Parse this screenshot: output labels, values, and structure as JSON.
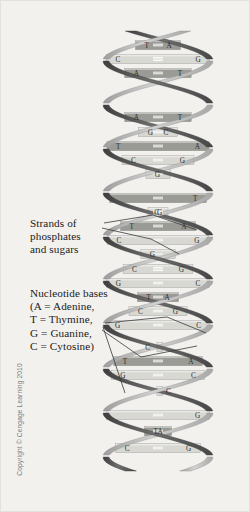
{
  "figure": {
    "background_color": "#f2f1ee",
    "frame_color": "#e2e1dd"
  },
  "annotations": {
    "strands_label": "Strands of\nphosphates\nand sugars",
    "bases_label": "Nucleotide bases\n(A = Adenine,\nT = Thymine,\nG = Guanine,\nC = Cytosine)"
  },
  "credit": {
    "text": "Copyright © Cengage Learning 2010",
    "color": "#7c7c7c"
  },
  "legend": {
    "entries": [
      {
        "code": "A",
        "name": "Adenine"
      },
      {
        "code": "T",
        "name": "Thymine"
      },
      {
        "code": "G",
        "name": "Guanine"
      },
      {
        "code": "C",
        "name": "Cytosine"
      }
    ]
  },
  "colors": {
    "backbone_dark": "#5d5d5d",
    "backbone_light": "#b9b9b9",
    "rung_light": "#d8d8d2",
    "rung_dark": "#9b9b96",
    "base_text": "#2a2a2a",
    "hbond": "#ffffff",
    "leader_line": "#3a3a3a"
  },
  "chart_data": {
    "type": "diagram",
    "base_pairs": [
      {
        "index": 1,
        "y": 44,
        "left": "T",
        "right": "A",
        "bonds": 2,
        "shade": "dark",
        "x_left": 126,
        "x_right": 205,
        "width": 96,
        "x": 118
      },
      {
        "index": 2,
        "y": 58,
        "left": "C",
        "right": "G",
        "bonds": 3,
        "shade": "light",
        "x_left": 117,
        "x_right": 213,
        "width": 112,
        "x": 110
      },
      {
        "index": 3,
        "y": 72,
        "left": "A",
        "right": "T",
        "bonds": 2,
        "shade": "dark",
        "x_left": 113,
        "x_right": 165,
        "width": 72,
        "x": 106
      },
      {
        "index": 4,
        "y": 116,
        "left": "A",
        "right": "T",
        "bonds": 2,
        "shade": "dark",
        "x_left": 113,
        "x_right": 163,
        "width": 70,
        "x": 106
      },
      {
        "index": 5,
        "y": 131,
        "left": "G",
        "right": "C",
        "bonds": 2,
        "shade": "light",
        "x_left": 110,
        "x_right": 166,
        "width": 90,
        "x": 103
      },
      {
        "index": 6,
        "y": 145,
        "left": "T",
        "right": "A",
        "bonds": 2,
        "shade": "dark",
        "x_left": 125,
        "x_right": 205,
        "width": 100,
        "x": 116
      },
      {
        "index": 7,
        "y": 159,
        "left": "C",
        "right": "G",
        "bonds": 2,
        "shade": "light",
        "x_left": 148,
        "x_right": 212,
        "width": 82,
        "x": 138
      },
      {
        "index": 8,
        "y": 173,
        "left": "G",
        "right": "",
        "bonds": 1,
        "shade": "light",
        "x_left": 137,
        "x_right": 0,
        "width": 46,
        "x": 130
      },
      {
        "index": 9,
        "y": 197,
        "left": "",
        "right": "T",
        "bonds": 2,
        "shade": "dark",
        "x_left": 0,
        "x_right": 185,
        "width": 44,
        "x": 152
      },
      {
        "index": 10,
        "y": 211,
        "left": "G",
        "right": "C",
        "bonds": 2,
        "shade": "light",
        "x_left": 110,
        "x_right": 168,
        "width": 94,
        "x": 103
      },
      {
        "index": 11,
        "y": 225,
        "left": "T",
        "right": "A",
        "bonds": 2,
        "shade": "dark",
        "x_left": 128,
        "x_right": 204,
        "width": 98,
        "x": 118
      },
      {
        "index": 12,
        "y": 239,
        "left": "C",
        "right": "G",
        "bonds": 2,
        "shade": "light",
        "x_left": 118,
        "x_right": 186,
        "width": 84,
        "x": 112
      },
      {
        "index": 13,
        "y": 253,
        "left": "G",
        "right": "",
        "bonds": 1,
        "shade": "light",
        "x_left": 110,
        "x_right": 0,
        "width": 42,
        "x": 104
      },
      {
        "index": 14,
        "y": 268,
        "left": "C",
        "right": "G",
        "bonds": 3,
        "shade": "light",
        "x_left": 130,
        "x_right": 168,
        "width": 56,
        "x": 124
      },
      {
        "index": 15,
        "y": 282,
        "left": "G",
        "right": "C",
        "bonds": 2,
        "shade": "light",
        "x_left": 118,
        "x_right": 172,
        "width": 88,
        "x": 112
      },
      {
        "index": 16,
        "y": 296,
        "left": "T",
        "right": "A",
        "bonds": 2,
        "shade": "dark",
        "x_left": 126,
        "x_right": 202,
        "width": 98,
        "x": 118
      },
      {
        "index": 17,
        "y": 310,
        "left": "C",
        "right": "G",
        "bonds": 2,
        "shade": "light",
        "x_left": 146,
        "x_right": 208,
        "width": 80,
        "x": 136
      },
      {
        "index": 18,
        "y": 324,
        "left": "G",
        "right": "C",
        "bonds": 2,
        "shade": "light",
        "x_left": 152,
        "x_right": 186,
        "width": 48,
        "x": 146
      },
      {
        "index": 19,
        "y": 346,
        "left": "",
        "right": "C",
        "bonds": 0,
        "shade": "light",
        "x_left": 0,
        "x_right": 186,
        "width": 38,
        "x": 164
      },
      {
        "index": 20,
        "y": 360,
        "left": "T",
        "right": "A",
        "bonds": 2,
        "shade": "dark",
        "x_left": 150,
        "x_right": 205,
        "width": 74,
        "x": 142
      },
      {
        "index": 21,
        "y": 374,
        "left": "G",
        "right": "C",
        "bonds": 2,
        "shade": "light",
        "x_left": 112,
        "x_right": 178,
        "width": 96,
        "x": 106
      },
      {
        "index": 22,
        "y": 390,
        "left": "C",
        "right": "",
        "bonds": 1,
        "shade": "light",
        "x_left": 112,
        "x_right": 0,
        "width": 48,
        "x": 106
      },
      {
        "index": 23,
        "y": 414,
        "left": "",
        "right": "G",
        "bonds": 2,
        "shade": "light",
        "x_left": 0,
        "x_right": 172,
        "width": 48,
        "x": 138
      },
      {
        "index": 24,
        "y": 430,
        "left": "T",
        "right": "A",
        "bonds": 2,
        "shade": "dark",
        "x_left": 128,
        "x_right": 198,
        "width": 92,
        "x": 120
      },
      {
        "index": 25,
        "y": 447,
        "left": "C",
        "right": "G",
        "bonds": 2,
        "shade": "light",
        "x_left": 122,
        "x_right": 202,
        "width": 104,
        "x": 114
      }
    ],
    "strand_count": 2,
    "turns": 5
  }
}
